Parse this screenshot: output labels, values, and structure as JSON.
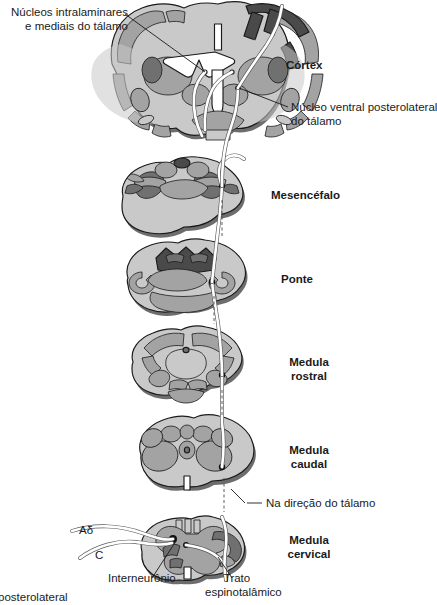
{
  "figure": {
    "title_visible": false,
    "background": "#ffffff",
    "palette": {
      "outline": "#1a1a1a",
      "light_gray": "#c9c9c9",
      "mid_gray": "#a3a3a3",
      "dark_gray": "#707070",
      "darkest_gray": "#4a4a4a",
      "tract_fill": "#ffffff",
      "tract_stroke": "#5a5a5a",
      "neuron_dot": "#111111"
    }
  },
  "labels": {
    "intralaminar": "Núcleos intralaminares\ne mediais do tálamo",
    "cortex": "Córtex",
    "vpl": "Núcleo ventral posterolateral\ndo tálamo",
    "midbrain": "Mesencéfalo",
    "pons": "Ponte",
    "medulla_rostral": "Medula\nrostral",
    "medulla_caudal": "Medula\ncaudal",
    "toward_thalamus": "Na direção do tálamo",
    "medulla_cervical": "Medula\ncervical",
    "fiber_adelta": "Aδ",
    "fiber_c": "C",
    "interneuron": "Interneurônio",
    "spinothalamic_tract": "Trato\nespinotalâmico",
    "clipped_bottom": "posterolateral"
  },
  "sections": [
    {
      "id": "cerebrum",
      "label": "Córtex",
      "level": 1
    },
    {
      "id": "midbrain",
      "label": "Mesencéfalo",
      "level": 2
    },
    {
      "id": "pons",
      "label": "Ponte",
      "level": 3
    },
    {
      "id": "medulla-rostral",
      "label": "Medula rostral",
      "level": 4
    },
    {
      "id": "medulla-caudal",
      "label": "Medula caudal",
      "level": 5
    },
    {
      "id": "spinal-cervical",
      "label": "Medula cervical",
      "level": 6
    }
  ]
}
